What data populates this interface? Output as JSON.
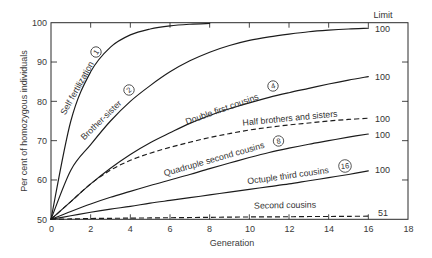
{
  "chart_data": {
    "type": "line",
    "title": "",
    "xlabel": "Generation",
    "ylabel": "Per cent of homozygous individuals",
    "xlim": [
      0,
      18
    ],
    "ylim": [
      50,
      100
    ],
    "xticks": [
      0,
      2,
      4,
      6,
      8,
      10,
      12,
      14,
      16,
      18
    ],
    "yticks": [
      50,
      60,
      70,
      80,
      90,
      100
    ],
    "grid": false,
    "legend": "none (curves labelled directly)",
    "limit_header": "Limit",
    "series": [
      {
        "name": "Self fertilization",
        "marker": "1",
        "style": "solid",
        "limit": null,
        "x": [
          0,
          1,
          2,
          3,
          4,
          5,
          6,
          7,
          8
        ],
        "values": [
          50,
          75,
          87.5,
          93.8,
          96.9,
          98.4,
          99.2,
          99.6,
          99.8
        ]
      },
      {
        "name": "Brother-sister",
        "marker": "2",
        "style": "solid",
        "limit": "100",
        "x": [
          0,
          1,
          2,
          3,
          4,
          5,
          6,
          7,
          8,
          9,
          10,
          11,
          12,
          13,
          14,
          15,
          16
        ],
        "values": [
          50,
          62.5,
          69,
          75,
          80,
          84,
          87.5,
          90.3,
          92.5,
          94.2,
          95.5,
          96.4,
          97.1,
          97.7,
          98.1,
          98.4,
          98.6
        ]
      },
      {
        "name": "Double first cousins",
        "marker": "4",
        "style": "solid",
        "limit": "100",
        "x": [
          0,
          1,
          2,
          3,
          4,
          5,
          6,
          7,
          8,
          9,
          10,
          11,
          12,
          13,
          14,
          15,
          16
        ],
        "values": [
          50,
          54.5,
          59,
          63,
          66.5,
          69.5,
          72,
          74.4,
          76.4,
          78.1,
          79.6,
          81,
          82.2,
          83.3,
          84.4,
          85.4,
          86.3
        ]
      },
      {
        "name": "Half brothers and sisters",
        "marker": null,
        "style": "dashed",
        "limit": "100",
        "x": [
          0,
          1,
          2,
          3,
          4,
          5,
          6,
          7,
          8,
          9,
          10,
          11,
          12,
          13,
          14,
          15,
          16
        ],
        "values": [
          50,
          54.5,
          59,
          62.5,
          65,
          66.8,
          68.3,
          69.6,
          70.8,
          71.8,
          72.7,
          73.4,
          74,
          74.5,
          75,
          75.4,
          75.7
        ]
      },
      {
        "name": "Quadruple second cousins",
        "marker": "8",
        "style": "solid",
        "limit": "100",
        "x": [
          0,
          1,
          2,
          3,
          4,
          5,
          6,
          7,
          8,
          9,
          10,
          11,
          12,
          13,
          14,
          15,
          16
        ],
        "values": [
          50,
          52,
          53.9,
          55.6,
          57.1,
          58.6,
          60,
          61.4,
          62.9,
          64.3,
          65.7,
          67,
          68.1,
          69.1,
          70,
          70.9,
          71.7
        ]
      },
      {
        "name": "Octuple third cousins",
        "marker": "16",
        "style": "solid",
        "limit": "100",
        "x": [
          0,
          1,
          2,
          3,
          4,
          5,
          6,
          7,
          8,
          9,
          10,
          11,
          12,
          13,
          14,
          15,
          16
        ],
        "values": [
          50,
          50.9,
          51.8,
          52.6,
          53.3,
          54.1,
          54.8,
          55.5,
          56.2,
          56.9,
          57.6,
          58.3,
          59,
          59.8,
          60.6,
          61.4,
          62.3
        ]
      },
      {
        "name": "Second cousins",
        "marker": null,
        "style": "dashed",
        "limit": "51",
        "x": [
          0,
          1,
          2,
          3,
          4,
          5,
          6,
          7,
          8,
          9,
          10,
          11,
          12,
          13,
          14,
          15,
          16
        ],
        "values": [
          50,
          50.1,
          50.2,
          50.25,
          50.3,
          50.35,
          50.4,
          50.45,
          50.5,
          50.55,
          50.6,
          50.62,
          50.65,
          50.7,
          50.72,
          50.75,
          50.8
        ]
      }
    ]
  }
}
